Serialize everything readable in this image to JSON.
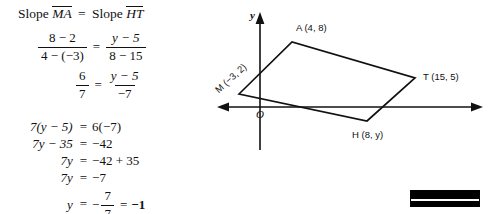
{
  "problem": {
    "heading": {
      "slope_word_1": "Slope",
      "segment_1": "MA",
      "equals": "=",
      "slope_word_2": "Slope",
      "segment_2": "HT"
    },
    "equation_1": {
      "left_numerator": "8 − 2",
      "left_denominator": "4 − (−3)",
      "equals": "=",
      "right_numerator": "y − 5",
      "right_denominator": "8 − 15"
    },
    "equation_2": {
      "left_numerator": "6",
      "left_denominator": "7",
      "equals": "=",
      "right_numerator": "y − 5",
      "right_denominator": "−7"
    },
    "steps": [
      {
        "lhs": "7(y − 5)",
        "rel": "=",
        "rhs": "6(−7)",
        "bold": false
      },
      {
        "lhs": "7y − 35",
        "rel": "=",
        "rhs": "−42",
        "bold": false
      },
      {
        "lhs": "7y",
        "rel": "=",
        "rhs": "−42 + 35",
        "bold": false
      },
      {
        "lhs": "7y",
        "rel": "=",
        "rhs": "−7",
        "bold": false
      }
    ],
    "final_step": {
      "lhs": "y",
      "rel": "=",
      "minus": "−",
      "numerator": "7",
      "denominator": "7",
      "equals": "=",
      "answer": "−1"
    }
  },
  "diagram": {
    "axis_label_y": "y",
    "origin_label": "O",
    "vertices": [
      {
        "name": "M",
        "label": "M (−3, 2)",
        "coords": "(−3, 2)",
        "x": 239,
        "y": 94
      },
      {
        "name": "A",
        "label": "A (4, 8)",
        "coords": "(4, 8)",
        "x": 292,
        "y": 42
      },
      {
        "name": "T",
        "label": "T (15, 5)",
        "coords": "(15, 5)",
        "x": 415,
        "y": 78
      },
      {
        "name": "H",
        "label": "H (8, y)",
        "coords": "(8, y)",
        "x": 367,
        "y": 121
      }
    ],
    "stroke_color": "#111111",
    "background": "#ffffff"
  },
  "redaction": {
    "present": true,
    "color": "#000000"
  }
}
